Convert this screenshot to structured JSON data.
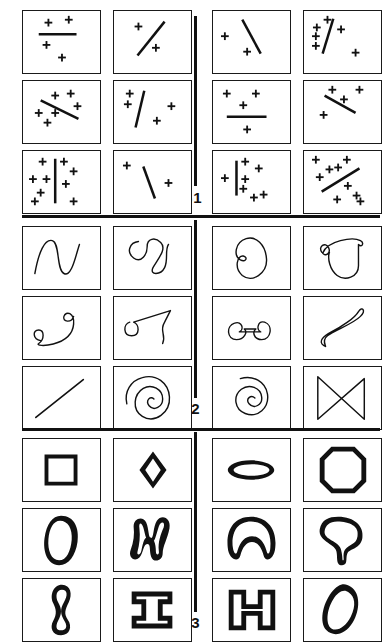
{
  "figure": {
    "background_color": "#ffffff",
    "ink_color": "#111111",
    "panel_count": 3,
    "cells_per_panel": 12
  },
  "sections": [
    {
      "number": "61",
      "caption_label": "61",
      "kind": "plus-signs-and-lines",
      "left_cells": [
        {
          "id": "61-L1",
          "name": "horizontal-bar-with-four-plusses",
          "plus_count": 4,
          "line": "horizontal"
        },
        {
          "id": "61-L2",
          "name": "diagonal-line-with-two-plusses",
          "plus_count": 2,
          "line": "diagonal-up"
        },
        {
          "id": "61-L3",
          "name": "descending-line-with-six-plusses",
          "plus_count": 6,
          "line": "diagonal-down"
        },
        {
          "id": "61-L4",
          "name": "steep-line-with-four-plusses",
          "plus_count": 4,
          "line": "steep-up"
        },
        {
          "id": "61-L5",
          "name": "vertical-line-with-nine-plusses",
          "plus_count": 9,
          "line": "vertical"
        },
        {
          "id": "61-L6",
          "name": "short-line-with-three-plusses",
          "plus_count": 3,
          "line": "steep-down"
        }
      ],
      "right_cells": [
        {
          "id": "61-R1",
          "name": "descending-line-with-two-plusses",
          "plus_count": 2,
          "line": "diagonal-down"
        },
        {
          "id": "61-R2",
          "name": "steep-line-with-six-plusses",
          "plus_count": 6,
          "line": "steep-up"
        },
        {
          "id": "61-R3",
          "name": "horizontal-bar-with-four-plusses",
          "plus_count": 4,
          "line": "horizontal"
        },
        {
          "id": "61-R4",
          "name": "descending-line-with-five-plusses",
          "plus_count": 5,
          "line": "diagonal-down"
        },
        {
          "id": "61-R5",
          "name": "vertical-line-with-eight-plusses",
          "plus_count": 8,
          "line": "vertical"
        },
        {
          "id": "61-R6",
          "name": "ascending-line-with-nine-plusses",
          "plus_count": 9,
          "line": "diagonal-up"
        }
      ]
    },
    {
      "number": "62",
      "caption_label": "62",
      "kind": "open-contours-and-curves",
      "left_cells": [
        {
          "id": "62-L1",
          "name": "double-hump-wave-curve"
        },
        {
          "id": "62-L2",
          "name": "double-loop-curl-curve"
        },
        {
          "id": "62-L3",
          "name": "s-curve-with-two-spirals"
        },
        {
          "id": "62-L4",
          "name": "hook-and-triangle-curve"
        },
        {
          "id": "62-L5",
          "name": "straight-diagonal-line"
        },
        {
          "id": "62-L6",
          "name": "dense-spiral"
        }
      ],
      "right_cells": [
        {
          "id": "62-R1",
          "name": "closed-kidney-contour"
        },
        {
          "id": "62-R2",
          "name": "cup-with-curled-handle"
        },
        {
          "id": "62-R3",
          "name": "wide-arch-with-two-curls"
        },
        {
          "id": "62-R4",
          "name": "elongated-teardrop-loop"
        },
        {
          "id": "62-R5",
          "name": "loose-spiral-with-tail"
        },
        {
          "id": "62-R6",
          "name": "bowtie-triangles"
        }
      ]
    },
    {
      "number": "63",
      "caption_label": "63",
      "kind": "closed-filled-shapes",
      "left_cells": [
        {
          "id": "63-L1",
          "name": "square-outline"
        },
        {
          "id": "63-L2",
          "name": "small-diamond"
        },
        {
          "id": "63-L3",
          "name": "tall-ellipse"
        },
        {
          "id": "63-L4",
          "name": "blob-letter-m"
        },
        {
          "id": "63-L5",
          "name": "hourglass-blob"
        },
        {
          "id": "63-L6",
          "name": "i-beam-shape"
        }
      ],
      "right_cells": [
        {
          "id": "63-R1",
          "name": "flat-lens-ellipse"
        },
        {
          "id": "63-R2",
          "name": "octagon"
        },
        {
          "id": "63-R3",
          "name": "arch-blob"
        },
        {
          "id": "63-R4",
          "name": "mushroom-blob"
        },
        {
          "id": "63-R5",
          "name": "letter-h-shape"
        },
        {
          "id": "63-R6",
          "name": "tilted-oval"
        }
      ]
    }
  ]
}
